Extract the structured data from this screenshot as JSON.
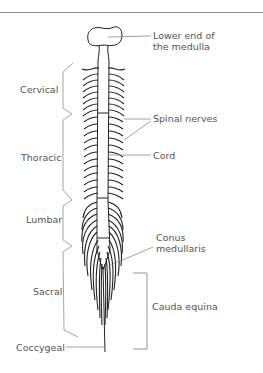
{
  "figure": {
    "type": "anatomical-diagram",
    "colors": {
      "line": "#222222",
      "label": "#555555",
      "bracket": "#9a9a9a",
      "rule": "#8a8a8a"
    }
  },
  "labels": {
    "medulla": {
      "line1": "Lower end of",
      "line2": "the medulla"
    },
    "spinal_nerves": "Spinal nerves",
    "cord": "Cord",
    "conus": {
      "line1": "Conus",
      "line2": "medullaris"
    },
    "cauda_equina": "Cauda equina"
  },
  "regions": [
    {
      "name": "Cervical"
    },
    {
      "name": "Thoracic"
    },
    {
      "name": "Lumbar"
    },
    {
      "name": "Sacral"
    },
    {
      "name": "Coccygeal"
    }
  ]
}
